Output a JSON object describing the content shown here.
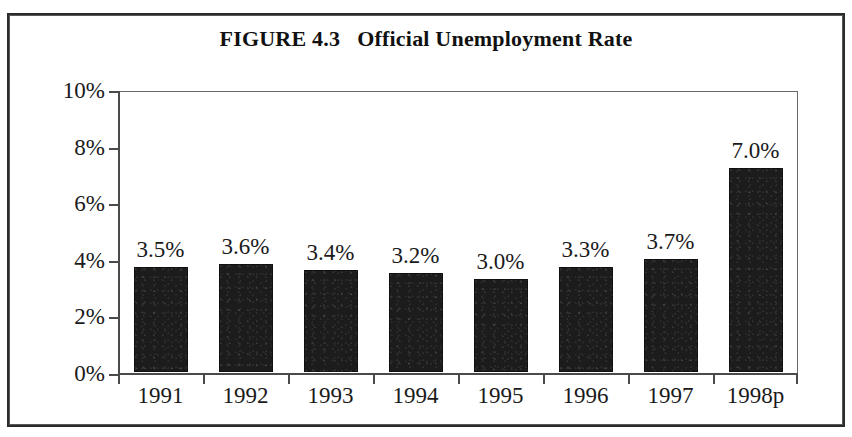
{
  "figure": {
    "title": "FIGURE 4.3   Official Unemployment Rate",
    "frame_color": "#2b2b2b",
    "bar_color": "#1c1c1c",
    "axis_color": "#4a4a4a"
  },
  "chart_data": {
    "type": "bar",
    "title": "FIGURE 4.3   Official Unemployment Rate",
    "xlabel": "",
    "ylabel": "",
    "categories": [
      "1991",
      "1992",
      "1993",
      "1994",
      "1995",
      "1996",
      "1997",
      "1998p"
    ],
    "values": [
      3.5,
      3.6,
      3.4,
      3.2,
      3.0,
      3.3,
      3.7,
      7.0
    ],
    "value_labels": [
      "3.5%",
      "3.6%",
      "3.4%",
      "3.2%",
      "3.0%",
      "3.3%",
      "3.7%",
      "7.0%"
    ],
    "bar_plotted_values": [
      3.7,
      3.8,
      3.6,
      3.5,
      3.3,
      3.7,
      4.0,
      7.2
    ],
    "ylim": [
      0,
      10
    ],
    "ytick_values": [
      0,
      2,
      4,
      6,
      8,
      10
    ],
    "ytick_labels": [
      "0%",
      "2%",
      "4%",
      "6%",
      "8%",
      "10%"
    ],
    "grid": false,
    "legend": false,
    "legend_position": "none",
    "units": "percent"
  }
}
